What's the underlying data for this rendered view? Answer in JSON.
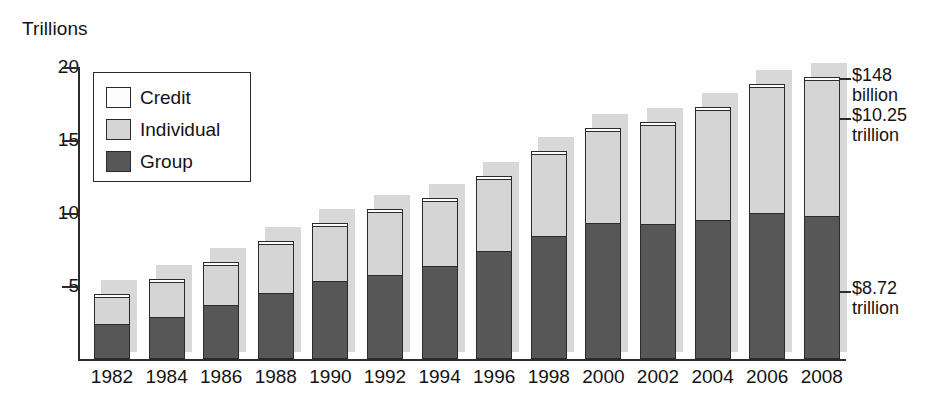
{
  "axis": {
    "unit_caption": "Trillions",
    "y_ticks": [
      {
        "label": "20",
        "value": 20
      },
      {
        "label": "15",
        "value": 15
      },
      {
        "label": "10",
        "value": 10
      },
      {
        "label": "5",
        "value": 5
      }
    ]
  },
  "legend": {
    "items": [
      {
        "label": "Credit",
        "color": "#fdfdfd"
      },
      {
        "label": "Individual",
        "color": "#d5d5d5"
      },
      {
        "label": "Group",
        "color": "#575757"
      }
    ]
  },
  "annotations": [
    {
      "id": "credit-annotation",
      "line1": "$148",
      "line2": "billion",
      "value": 0.148,
      "series": "Credit"
    },
    {
      "id": "individual-annotation",
      "line1": "$10.25",
      "line2": "trillion",
      "value": 10.25,
      "series": "Individual"
    },
    {
      "id": "group-annotation",
      "line1": "$8.72",
      "line2": "trillion",
      "value": 8.72,
      "series": "Group"
    }
  ],
  "chart_data": {
    "type": "bar",
    "title": "",
    "subtitle": "",
    "xlabel": "",
    "ylabel": "Trillions",
    "ylim": [
      0,
      20
    ],
    "grid": false,
    "stacked": true,
    "legend_position": "inside-top-left",
    "categories": [
      "1982",
      "1984",
      "1986",
      "1988",
      "1990",
      "1992",
      "1994",
      "1996",
      "1998",
      "2000",
      "2002",
      "2004",
      "2006",
      "2008"
    ],
    "series": [
      {
        "name": "Group",
        "color": "#575757",
        "values": [
          2.4,
          2.9,
          3.7,
          4.55,
          5.3,
          5.75,
          6.35,
          7.4,
          8.4,
          9.3,
          9.25,
          9.5,
          9.95,
          9.7
        ]
      },
      {
        "name": "Individual",
        "color": "#d5d5d5",
        "values": [
          2.0,
          2.5,
          2.85,
          3.4,
          3.85,
          4.4,
          4.5,
          5.0,
          5.7,
          6.4,
          6.85,
          7.6,
          8.75,
          9.4
        ]
      },
      {
        "name": "Credit",
        "color": "#fdfdfd",
        "values": [
          0.05,
          0.1,
          0.1,
          0.1,
          0.15,
          0.15,
          0.15,
          0.15,
          0.15,
          0.15,
          0.15,
          0.15,
          0.15,
          0.25
        ]
      }
    ],
    "totals": [
      4.45,
      5.5,
      6.65,
      8.05,
      9.3,
      10.3,
      11.0,
      12.55,
      14.25,
      15.85,
      16.25,
      17.25,
      18.85,
      19.35
    ]
  }
}
